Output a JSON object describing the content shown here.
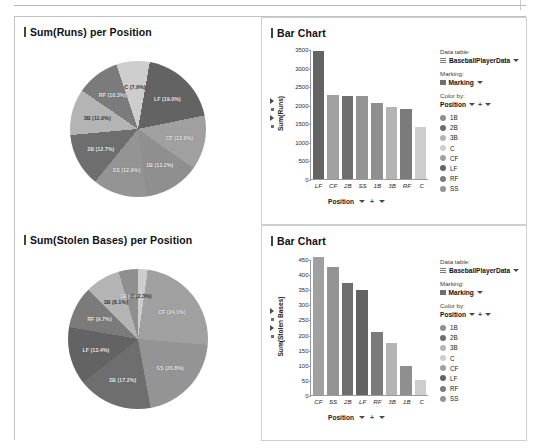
{
  "board": {
    "panels": 4
  },
  "palette": {
    "1B": "#8f8f8f",
    "2B": "#6e6e6e",
    "3B": "#b4b4b4",
    "C": "#cdcdcd",
    "CF": "#a0a0a0",
    "LF": "#636363",
    "RF": "#7b7b7b",
    "SS": "#949494"
  },
  "panel_runs_pie": {
    "title": "Sum(Runs) per Position",
    "chart_data": {
      "type": "pie",
      "title": "Sum(Runs) per Position",
      "categories": [
        "LF",
        "CF",
        "1B",
        "SS",
        "2B",
        "3B",
        "RF",
        "C"
      ],
      "values": [
        3460,
        2270,
        2040,
        2230,
        2240,
        1940,
        1890,
        1400
      ],
      "labels": [
        "LF (19.0%)",
        "CF (13.0%)",
        "1B (13.2%)",
        "SS (12.9%)",
        "2B (12.7%)",
        "3B (11.0%)",
        "RF (10.3%)",
        "C (7.9%)"
      ],
      "percents": [
        19.0,
        13.0,
        13.2,
        12.9,
        12.7,
        11.0,
        10.3,
        7.9
      ],
      "legend": "Position"
    }
  },
  "panel_runs_bar": {
    "title": "Bar Chart",
    "chart_data": {
      "type": "bar",
      "title": "Bar Chart",
      "categories": [
        "LF",
        "CF",
        "2B",
        "SS",
        "1B",
        "3B",
        "RF",
        "C"
      ],
      "values": [
        3460,
        2270,
        2240,
        2230,
        2040,
        1940,
        1890,
        1400
      ],
      "xlabel": "Position",
      "ylabel": "Sum(Runs)",
      "ylim": [
        0,
        3500
      ],
      "yticks": [
        0,
        500,
        1000,
        1500,
        2000,
        2500,
        3000,
        3500
      ],
      "grid": false,
      "legend_position": "right"
    },
    "controls": {
      "data_table_label": "Data table:",
      "data_table_value": "BaseballPlayerData",
      "marking_label": "Marking:",
      "marking_value": "Marking",
      "color_by_label": "Color by:",
      "color_by_value": "Position",
      "legend_items": [
        "1B",
        "2B",
        "3B",
        "C",
        "CF",
        "LF",
        "RF",
        "SS"
      ]
    },
    "axis_control": {
      "label": "Position"
    }
  },
  "panel_sb_pie": {
    "title": "Sum(Stolen Bases) per Position",
    "chart_data": {
      "type": "pie",
      "title": "Sum(Stolen Bases) per Position",
      "categories": [
        "CF",
        "SS",
        "2B",
        "LF",
        "RF",
        "3B",
        "1B",
        "C"
      ],
      "values": [
        458,
        422,
        371,
        348,
        208,
        172,
        96,
        50
      ],
      "labels": [
        "CF (24.1%)",
        "SS (20.8%)",
        "2B (17.2%)",
        "LF (13.4%)",
        "RF (9.7%)",
        "3B (8.1%)",
        "1B (4.4%)",
        "C (2.3%)"
      ],
      "percents": [
        24.1,
        20.8,
        17.2,
        13.4,
        9.7,
        8.1,
        4.4,
        2.3
      ],
      "legend": "Position"
    }
  },
  "panel_sb_bar": {
    "title": "Bar Chart",
    "chart_data": {
      "type": "bar",
      "title": "Bar Chart",
      "categories": [
        "CF",
        "SS",
        "2B",
        "LF",
        "RF",
        "3B",
        "1B",
        "C"
      ],
      "values": [
        458,
        422,
        371,
        348,
        208,
        172,
        96,
        50
      ],
      "xlabel": "Position",
      "ylabel": "Sum(Stolen Bases)",
      "ylim": [
        0,
        450
      ],
      "yticks": [
        0,
        50,
        100,
        150,
        200,
        250,
        300,
        350,
        400,
        450
      ],
      "grid": false,
      "legend_position": "right"
    },
    "controls": {
      "data_table_label": "Data table:",
      "data_table_value": "BaseballPlayerData",
      "marking_label": "Marking:",
      "marking_value": "Marking",
      "color_by_label": "Color by:",
      "color_by_value": "Position",
      "legend_items": [
        "1B",
        "2B",
        "3B",
        "C",
        "CF",
        "LF",
        "RF",
        "SS"
      ]
    },
    "axis_control": {
      "label": "Position"
    }
  }
}
